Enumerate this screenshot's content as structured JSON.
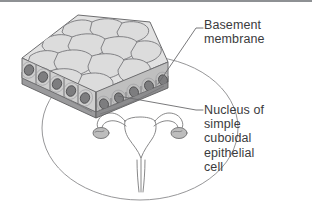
{
  "figure": {
    "title_visible": false,
    "background_color": "#ffffff",
    "border_rule_color": "#8e9194",
    "text_color": "#3b3b3d"
  },
  "labels": {
    "basement_membrane": "Basement\nmembrane",
    "nucleus": "Nucleus of\nsimple\ncuboidal\nepithelial\ncell"
  },
  "illustration": {
    "tissue_block_name": "simple-cuboidal-epithelium-block",
    "magnifier_circle_name": "magnification-circle",
    "organ_name": "uterus-and-ovaries-diagram",
    "cell_fill": "#dcdcdc",
    "cell_outline": "#6e6e70",
    "nucleus_fill": "#7d7d7f",
    "nucleus_outline": "#4a4a4c",
    "membrane_fill": "#9a9a9c",
    "side_shade": "#bfbfbf",
    "leader_line_color": "#6a6a6c",
    "circle_line_color": "#8a8a8c",
    "organ_line_color": "#7a7a7c",
    "ovary_fill": "#bdbdbd"
  }
}
